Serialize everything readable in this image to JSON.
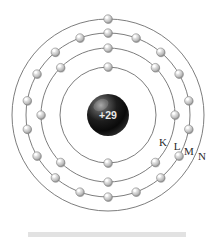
{
  "figure": {
    "type": "bohr-atomic-model"
  },
  "nucleus": {
    "charge_label": "+29",
    "element": "copper",
    "atomic_number": 29,
    "radius_px": 21,
    "center": {
      "x": 108,
      "y": 115
    },
    "color_dark": "#0a0a0a",
    "color_highlight": "#bdbdbd"
  },
  "shell_labels": [
    {
      "name": "K",
      "text": "K",
      "x": 163,
      "y": 146
    },
    {
      "name": "L",
      "text": "L",
      "x": 177,
      "y": 150
    },
    {
      "name": "M",
      "text": "M",
      "x": 189,
      "y": 155
    },
    {
      "name": "N",
      "text": "N",
      "x": 202,
      "y": 160
    }
  ],
  "electron": {
    "radius_px": 4.2,
    "fill_light": "#ffffff",
    "fill_mid": "#c8c8c8",
    "fill_dark": "#8a8a8a",
    "stroke": "#6f6f6f"
  },
  "colors": {
    "orbit_stroke": "#6e6e6e",
    "background": "#ffffff",
    "footer_bar": "#e2e2e2",
    "label_text": "#2b2b2b"
  },
  "footer": {
    "bar_color": "#e2e2e2",
    "width_px": 158,
    "height_px": 5
  },
  "chart_data": {
    "type": "scatter",
    "xlabel": "",
    "ylabel": "",
    "center": {
      "x": 108,
      "y": 115
    },
    "nucleus_charge": "+29",
    "shells": [
      {
        "name": "K",
        "label": "K",
        "index": 1,
        "radius": 48,
        "electron_count": 2,
        "electron_angles_deg": [
          90,
          270
        ]
      },
      {
        "name": "L",
        "label": "L",
        "index": 2,
        "radius": 67,
        "electron_count": 8,
        "electron_angles_deg": [
          90,
          135,
          180,
          225,
          270,
          315,
          0,
          45
        ]
      },
      {
        "name": "M",
        "label": "M",
        "index": 3,
        "radius": 82,
        "electron_count": 18,
        "electron_angles_deg": [
          90,
          110,
          130,
          150,
          170,
          190,
          210,
          230,
          250,
          270,
          290,
          310,
          330,
          350,
          10,
          30,
          50,
          70
        ]
      },
      {
        "name": "N",
        "label": "N",
        "index": 4,
        "radius": 96,
        "electron_count": 1,
        "electron_angles_deg": [
          90
        ]
      }
    ],
    "electron_configuration": [
      2,
      8,
      18,
      1
    ],
    "legend_position": "inline-right"
  }
}
